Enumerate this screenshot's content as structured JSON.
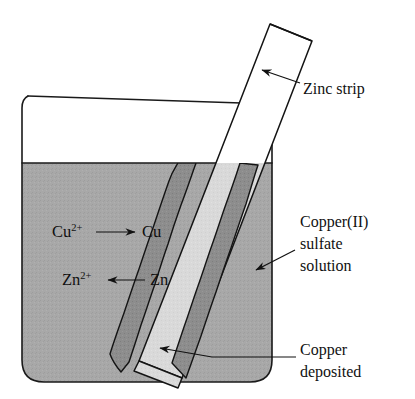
{
  "diagram": {
    "colors": {
      "background": "#ffffff",
      "solution": "#a8a8a8",
      "solution_texture": "#9f9f9f",
      "strip_submerged": "#d9d9d9",
      "strip_above": "#ffffff",
      "copper_deposit": "#8a8a8a",
      "copper_deposit_dark": "#6f6f6f",
      "outline": "#141414",
      "text": "#111111"
    },
    "labels": [
      {
        "id": "zinc-strip",
        "name": "zinc-strip-label",
        "lines": [
          "Zinc strip"
        ],
        "x": 303,
        "y": 94,
        "anchor": "start",
        "font_size": 16.5
      },
      {
        "id": "copper-sulfate-solution",
        "name": "copper-sulfate-solution-label",
        "lines": [
          "Copper(II)",
          "sulfate",
          "solution"
        ],
        "x": 300,
        "y": 227,
        "anchor": "start",
        "font_size": 16.5
      },
      {
        "id": "copper-deposited",
        "name": "copper-deposited-label",
        "lines": [
          "Copper",
          "deposited"
        ],
        "x": 300,
        "y": 355,
        "anchor": "start",
        "font_size": 16.5
      }
    ],
    "equations": [
      {
        "id": "copper-reduction",
        "name": "copper-reduction-equation",
        "species_left": "Cu",
        "charge_left": "2+",
        "arrow": "⟶",
        "arrow_direction": "right",
        "species_right": "Cu",
        "x": 52,
        "y": 237,
        "full_text": "Cu2+ ⟶ Cu"
      },
      {
        "id": "zinc-oxidation",
        "name": "zinc-oxidation-equation",
        "species_left": "Zn",
        "charge_left": "2+",
        "arrow": "⟵",
        "arrow_direction": "left",
        "species_right": "Zn",
        "x": 62,
        "y": 285,
        "full_text": "Zn2+ ⟵ Zn"
      }
    ],
    "geometry": {
      "beaker": {
        "left_wall_x": 22,
        "right_wall_x": 272,
        "rim_y": 102,
        "bottom_y": 382,
        "corner_radius": 22,
        "liquid_surface_y": 163
      },
      "strip": {
        "top_left_x": 270,
        "top_y": 24,
        "bottom_y": 378,
        "angle_deg": 22,
        "width": 42
      }
    }
  }
}
